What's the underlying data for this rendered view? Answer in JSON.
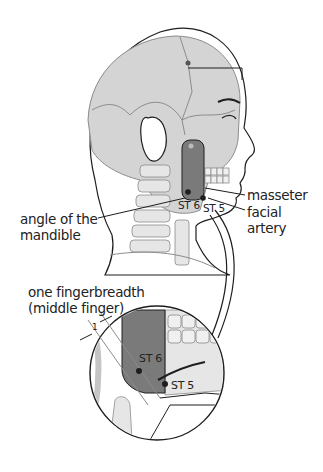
{
  "diagram": {
    "colors": {
      "skull_fill": "#d4d4d4",
      "masseter_fill": "#7a7a7a",
      "outline": "#1e1e1e",
      "bone_stroke": "#8c8c8c"
    }
  },
  "labels": {
    "masseter": "masseter",
    "facial_artery_line1": "facial",
    "facial_artery_line2": "artery",
    "angle_line1": "angle of the",
    "angle_line2": "mandible",
    "fingerbreadth_line1": "one fingerbreadth",
    "fingerbreadth_line2": "(middle finger)",
    "measure_unit": "1"
  },
  "points": {
    "st6_main": "ST 6",
    "st5_main": "ST 5",
    "st6_inset": "ST 6",
    "st5_inset": "ST 5"
  }
}
